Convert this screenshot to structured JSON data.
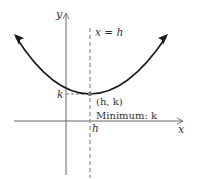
{
  "diagram": {
    "axes": {
      "x_label": "x",
      "y_label": "y"
    },
    "axis_of_symmetry_label": "x = h",
    "vertex_label": "(h, k)",
    "minimum_label": "Minimum: k",
    "h_tick_label": "h",
    "k_tick_label": "k",
    "colors": {
      "curve": "#1a1a1a",
      "axes": "#555555",
      "dashed": "#666666",
      "vertex_point": "#777777",
      "text": "#333333"
    }
  }
}
